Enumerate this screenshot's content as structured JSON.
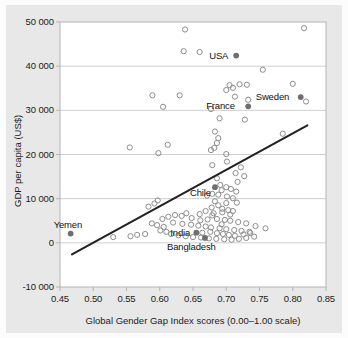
{
  "chart_data": {
    "type": "scatter",
    "title": "",
    "xlabel": "Global Gender Gap Index scores (0.00–1.00 scale)",
    "ylabel": "GDP per capita (US$)",
    "xlim": [
      0.45,
      0.85
    ],
    "ylim": [
      -10000,
      50000
    ],
    "xticks": [
      "0.45",
      "0.50",
      "0.55",
      "0.60",
      "0.65",
      "0.70",
      "0.75",
      "0.80",
      "0.85"
    ],
    "xtick_values": [
      0.45,
      0.5,
      0.55,
      0.6,
      0.65,
      0.7,
      0.75,
      0.8,
      0.85
    ],
    "yticks": [
      "50 000",
      "40 000",
      "30 000",
      "20 000",
      "10 000",
      "0",
      "-10 000"
    ],
    "ytick_values": [
      50000,
      40000,
      30000,
      20000,
      10000,
      0,
      -10000
    ],
    "grid": "horizontal",
    "legend": "none",
    "marker_unlabeled": "open-circle",
    "marker_labeled": "filled-circle",
    "trendline": {
      "type": "linear",
      "x_start": 0.468,
      "y_start": -2600,
      "x_end": 0.822,
      "y_end": 26600
    },
    "labeled_points": [
      {
        "name": "USA",
        "x": 0.715,
        "y": 42400,
        "label_side": "left"
      },
      {
        "name": "Sweden",
        "x": 0.812,
        "y": 33000,
        "label_side": "left"
      },
      {
        "name": "France",
        "x": 0.733,
        "y": 30900,
        "label_side": "left"
      },
      {
        "name": "Chile",
        "x": 0.683,
        "y": 12600,
        "label_side": "left-below"
      },
      {
        "name": "Yemen",
        "x": 0.466,
        "y": 2100,
        "label_side": "above"
      },
      {
        "name": "India",
        "x": 0.655,
        "y": 2300,
        "label_side": "left"
      },
      {
        "name": "Bangladesh",
        "x": 0.668,
        "y": 1100,
        "label_side": "below"
      }
    ],
    "unlabeled_points": [
      {
        "x": 0.638,
        "y": 48300
      },
      {
        "x": 0.817,
        "y": 48600
      },
      {
        "x": 0.636,
        "y": 43400
      },
      {
        "x": 0.66,
        "y": 43200
      },
      {
        "x": 0.755,
        "y": 39200
      },
      {
        "x": 0.8,
        "y": 36000
      },
      {
        "x": 0.72,
        "y": 35900
      },
      {
        "x": 0.731,
        "y": 35800
      },
      {
        "x": 0.705,
        "y": 35700
      },
      {
        "x": 0.71,
        "y": 35100
      },
      {
        "x": 0.7,
        "y": 34600
      },
      {
        "x": 0.82,
        "y": 32000
      },
      {
        "x": 0.713,
        "y": 33100
      },
      {
        "x": 0.733,
        "y": 32400
      },
      {
        "x": 0.589,
        "y": 33400
      },
      {
        "x": 0.63,
        "y": 33400
      },
      {
        "x": 0.605,
        "y": 30800
      },
      {
        "x": 0.677,
        "y": 30300
      },
      {
        "x": 0.69,
        "y": 28200
      },
      {
        "x": 0.728,
        "y": 27900
      },
      {
        "x": 0.683,
        "y": 25200
      },
      {
        "x": 0.785,
        "y": 24700
      },
      {
        "x": 0.688,
        "y": 23700
      },
      {
        "x": 0.686,
        "y": 22600
      },
      {
        "x": 0.612,
        "y": 22200
      },
      {
        "x": 0.555,
        "y": 21600
      },
      {
        "x": 0.677,
        "y": 21000
      },
      {
        "x": 0.682,
        "y": 21500
      },
      {
        "x": 0.7,
        "y": 20100
      },
      {
        "x": 0.598,
        "y": 20300
      },
      {
        "x": 0.701,
        "y": 18400
      },
      {
        "x": 0.679,
        "y": 17600
      },
      {
        "x": 0.722,
        "y": 17100
      },
      {
        "x": 0.714,
        "y": 15800
      },
      {
        "x": 0.727,
        "y": 15100
      },
      {
        "x": 0.686,
        "y": 14600
      },
      {
        "x": 0.717,
        "y": 13800
      },
      {
        "x": 0.691,
        "y": 13100
      },
      {
        "x": 0.7,
        "y": 12600
      },
      {
        "x": 0.707,
        "y": 12200
      },
      {
        "x": 0.693,
        "y": 11900
      },
      {
        "x": 0.715,
        "y": 11600
      },
      {
        "x": 0.679,
        "y": 11100
      },
      {
        "x": 0.688,
        "y": 10900
      },
      {
        "x": 0.671,
        "y": 10700
      },
      {
        "x": 0.701,
        "y": 10500
      },
      {
        "x": 0.71,
        "y": 10100
      },
      {
        "x": 0.583,
        "y": 8200
      },
      {
        "x": 0.592,
        "y": 8900
      },
      {
        "x": 0.597,
        "y": 9600
      },
      {
        "x": 0.716,
        "y": 9100
      },
      {
        "x": 0.7,
        "y": 9000
      },
      {
        "x": 0.688,
        "y": 8500
      },
      {
        "x": 0.678,
        "y": 8000
      },
      {
        "x": 0.694,
        "y": 7700
      },
      {
        "x": 0.703,
        "y": 7400
      },
      {
        "x": 0.71,
        "y": 7200
      },
      {
        "x": 0.694,
        "y": 6900
      },
      {
        "x": 0.681,
        "y": 6700
      },
      {
        "x": 0.64,
        "y": 6700
      },
      {
        "x": 0.623,
        "y": 6300
      },
      {
        "x": 0.633,
        "y": 6100
      },
      {
        "x": 0.613,
        "y": 5900
      },
      {
        "x": 0.604,
        "y": 5400
      },
      {
        "x": 0.648,
        "y": 5600
      },
      {
        "x": 0.661,
        "y": 5100
      },
      {
        "x": 0.672,
        "y": 5300
      },
      {
        "x": 0.686,
        "y": 5400
      },
      {
        "x": 0.698,
        "y": 5200
      },
      {
        "x": 0.706,
        "y": 5000
      },
      {
        "x": 0.718,
        "y": 4700
      },
      {
        "x": 0.73,
        "y": 4400
      },
      {
        "x": 0.744,
        "y": 3800
      },
      {
        "x": 0.759,
        "y": 3300
      },
      {
        "x": 0.62,
        "y": 4600
      },
      {
        "x": 0.634,
        "y": 4300
      },
      {
        "x": 0.647,
        "y": 4100
      },
      {
        "x": 0.658,
        "y": 3900
      },
      {
        "x": 0.669,
        "y": 3700
      },
      {
        "x": 0.677,
        "y": 3500
      },
      {
        "x": 0.69,
        "y": 3300
      },
      {
        "x": 0.7,
        "y": 3100
      },
      {
        "x": 0.712,
        "y": 2900
      },
      {
        "x": 0.723,
        "y": 2700
      },
      {
        "x": 0.735,
        "y": 2500
      },
      {
        "x": 0.588,
        "y": 4400
      },
      {
        "x": 0.596,
        "y": 4000
      },
      {
        "x": 0.606,
        "y": 3600
      },
      {
        "x": 0.601,
        "y": 2800
      },
      {
        "x": 0.61,
        "y": 2500
      },
      {
        "x": 0.578,
        "y": 2000
      },
      {
        "x": 0.566,
        "y": 1800
      },
      {
        "x": 0.556,
        "y": 1500
      },
      {
        "x": 0.53,
        "y": 1300
      },
      {
        "x": 0.617,
        "y": 2000
      },
      {
        "x": 0.628,
        "y": 1700
      },
      {
        "x": 0.639,
        "y": 1500
      },
      {
        "x": 0.65,
        "y": 1300
      },
      {
        "x": 0.662,
        "y": 1200
      },
      {
        "x": 0.674,
        "y": 1000
      },
      {
        "x": 0.685,
        "y": 900
      },
      {
        "x": 0.697,
        "y": 800
      },
      {
        "x": 0.708,
        "y": 700
      },
      {
        "x": 0.719,
        "y": 900
      },
      {
        "x": 0.73,
        "y": 1100
      },
      {
        "x": 0.742,
        "y": 1400
      },
      {
        "x": 0.664,
        "y": 2300
      },
      {
        "x": 0.676,
        "y": 2500
      },
      {
        "x": 0.686,
        "y": 2200
      },
      {
        "x": 0.695,
        "y": 2000
      },
      {
        "x": 0.704,
        "y": 1800
      },
      {
        "x": 0.713,
        "y": 1600
      },
      {
        "x": 0.726,
        "y": 1900
      },
      {
        "x": 0.736,
        "y": 2200
      },
      {
        "x": 0.679,
        "y": 6200
      },
      {
        "x": 0.706,
        "y": 6400
      },
      {
        "x": 0.693,
        "y": 4200
      },
      {
        "x": 0.683,
        "y": 9400
      },
      {
        "x": 0.669,
        "y": 7200
      },
      {
        "x": 0.66,
        "y": 6500
      }
    ],
    "colors": {
      "panel_background": "#ffffff",
      "figure_background": "#e8e8e8",
      "gridline": "#cfcfcf",
      "axis_border": "#b4b4b4",
      "open_marker_stroke": "#8d8d8d",
      "filled_marker": "#6e6e6e",
      "trendline": "#222222",
      "text": "#1b1b1b"
    }
  }
}
